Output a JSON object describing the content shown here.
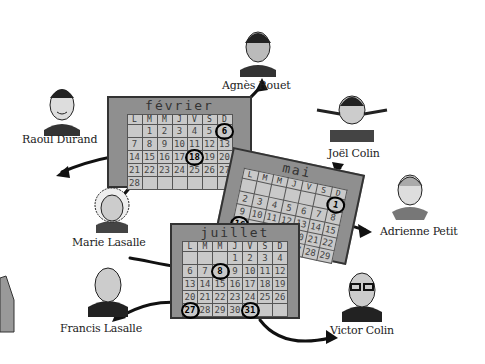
{
  "people": [
    {
      "id": "raoul-durand",
      "name": "Raoul Durand"
    },
    {
      "id": "agnes-rouet",
      "name": "Agnès Rouet"
    },
    {
      "id": "joel-colin",
      "name": "Joël Colin"
    },
    {
      "id": "adrienne-petit",
      "name": "Adrienne Petit"
    },
    {
      "id": "marie-lasalle",
      "name": "Marie Lasalle"
    },
    {
      "id": "francis-lasalle",
      "name": "Francis Lasalle"
    },
    {
      "id": "victor-colin",
      "name": "Victor Colin"
    }
  ],
  "weekday_headers": [
    "L",
    "M",
    "M",
    "J",
    "V",
    "S",
    "D"
  ],
  "calendars": [
    {
      "month": "février",
      "circled": [
        "6",
        "18"
      ],
      "rows": [
        [
          "",
          "1",
          "2",
          "3",
          "4",
          "5",
          "6"
        ],
        [
          "7",
          "8",
          "9",
          "10",
          "11",
          "12",
          "13"
        ],
        [
          "14",
          "15",
          "16",
          "17",
          "18",
          "19",
          "20"
        ],
        [
          "21",
          "22",
          "23",
          "24",
          "25",
          "26",
          "27"
        ],
        [
          "28",
          "",
          "",
          "",
          "",
          "",
          ""
        ]
      ]
    },
    {
      "month": "mai",
      "circled": [
        "1",
        "16"
      ],
      "rows": [
        [
          "",
          "",
          "",
          "",
          "",
          "",
          "1"
        ],
        [
          "2",
          "3",
          "4",
          "5",
          "6",
          "7",
          "8"
        ],
        [
          "9",
          "10",
          "11",
          "12",
          "13",
          "14",
          "15"
        ],
        [
          "16",
          "17",
          "18",
          "19",
          "20",
          "21",
          "22"
        ],
        [
          "23",
          "24",
          "25",
          "26",
          "27",
          "28",
          "29"
        ]
      ]
    },
    {
      "month": "juillet",
      "circled": [
        "8",
        "27",
        "31"
      ],
      "rows": [
        [
          "",
          "",
          "",
          "1",
          "2",
          "3",
          "4",
          "5"
        ],
        [
          "6",
          "7",
          "8",
          "9",
          "10",
          "11",
          "12"
        ],
        [
          "13",
          "14",
          "15",
          "16",
          "17",
          "18",
          "19"
        ],
        [
          "20",
          "21",
          "22",
          "23",
          "24",
          "25",
          "26"
        ],
        [
          "27",
          "28",
          "29",
          "30",
          "31",
          "",
          ""
        ]
      ]
    }
  ]
}
